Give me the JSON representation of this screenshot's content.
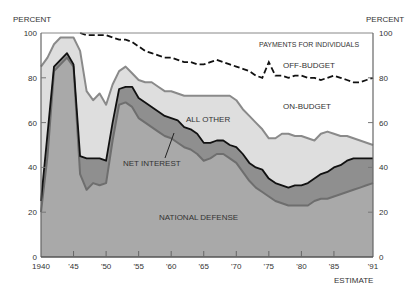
{
  "chart_data": {
    "type": "area",
    "title": "",
    "ylabel_left": "PERCENT",
    "ylabel_right": "PERCENT",
    "xlabel": "ESTIMATE",
    "ylim": [
      0,
      100
    ],
    "xlim": [
      1940,
      1991
    ],
    "x_ticks": [
      {
        "year": 1940,
        "label": "1940"
      },
      {
        "year": 1945,
        "label": "'45"
      },
      {
        "year": 1950,
        "label": "'50"
      },
      {
        "year": 1955,
        "label": "'55"
      },
      {
        "year": 1960,
        "label": "'60"
      },
      {
        "year": 1965,
        "label": "'65"
      },
      {
        "year": 1970,
        "label": "'70"
      },
      {
        "year": 1975,
        "label": "'75"
      },
      {
        "year": 1980,
        "label": "'80"
      },
      {
        "year": 1985,
        "label": "'85"
      },
      {
        "year": 1991,
        "label": "'91"
      }
    ],
    "y_ticks": [
      0,
      20,
      40,
      60,
      80,
      100
    ],
    "annotations": {
      "payments_for_individuals": "PAYMENTS FOR INDIVIDUALS",
      "off_budget": "OFF-BUDGET",
      "on_budget": "ON-BUDGET",
      "all_other": "ALL OTHER",
      "net_interest": "NET INTEREST",
      "national_defense": "NATIONAL DEFENSE"
    },
    "series": [
      {
        "name": "National Defense",
        "kind": "cumulative_top",
        "color": "#a9a9a9",
        "line_color": "#6e6e6e",
        "points": [
          [
            1940,
            20
          ],
          [
            1941,
            45
          ],
          [
            1942,
            83
          ],
          [
            1943,
            86
          ],
          [
            1944,
            89
          ],
          [
            1945,
            85
          ],
          [
            1946,
            37
          ],
          [
            1947,
            30
          ],
          [
            1948,
            33
          ],
          [
            1949,
            32
          ],
          [
            1950,
            33
          ],
          [
            1951,
            52
          ],
          [
            1952,
            68
          ],
          [
            1953,
            69
          ],
          [
            1954,
            67
          ],
          [
            1955,
            62
          ],
          [
            1956,
            60
          ],
          [
            1957,
            58
          ],
          [
            1958,
            56
          ],
          [
            1959,
            54
          ],
          [
            1960,
            53
          ],
          [
            1961,
            51
          ],
          [
            1962,
            49
          ],
          [
            1963,
            48
          ],
          [
            1964,
            46
          ],
          [
            1965,
            43
          ],
          [
            1966,
            44
          ],
          [
            1967,
            46
          ],
          [
            1968,
            46
          ],
          [
            1969,
            44
          ],
          [
            1970,
            42
          ],
          [
            1971,
            38
          ],
          [
            1972,
            34
          ],
          [
            1973,
            31
          ],
          [
            1974,
            29
          ],
          [
            1975,
            27
          ],
          [
            1976,
            25
          ],
          [
            1977,
            24
          ],
          [
            1978,
            23
          ],
          [
            1979,
            23
          ],
          [
            1980,
            23
          ],
          [
            1981,
            23
          ],
          [
            1982,
            25
          ],
          [
            1983,
            26
          ],
          [
            1984,
            26
          ],
          [
            1985,
            27
          ],
          [
            1986,
            28
          ],
          [
            1987,
            29
          ],
          [
            1988,
            30
          ],
          [
            1989,
            31
          ],
          [
            1990,
            32
          ],
          [
            1991,
            33
          ]
        ]
      },
      {
        "name": "Net Interest",
        "kind": "cumulative_top",
        "color": "#8f8f8f",
        "line_color": "#111111",
        "points": [
          [
            1940,
            25
          ],
          [
            1941,
            55
          ],
          [
            1942,
            85
          ],
          [
            1943,
            88
          ],
          [
            1944,
            91
          ],
          [
            1945,
            86
          ],
          [
            1946,
            45
          ],
          [
            1947,
            44
          ],
          [
            1948,
            44
          ],
          [
            1949,
            44
          ],
          [
            1950,
            43
          ],
          [
            1951,
            60
          ],
          [
            1952,
            75
          ],
          [
            1953,
            76
          ],
          [
            1954,
            76
          ],
          [
            1955,
            71
          ],
          [
            1956,
            69
          ],
          [
            1957,
            67
          ],
          [
            1958,
            65
          ],
          [
            1959,
            63
          ],
          [
            1960,
            62
          ],
          [
            1961,
            61
          ],
          [
            1962,
            58
          ],
          [
            1963,
            57
          ],
          [
            1964,
            55
          ],
          [
            1965,
            51
          ],
          [
            1966,
            51
          ],
          [
            1967,
            52
          ],
          [
            1968,
            52
          ],
          [
            1969,
            50
          ],
          [
            1970,
            49
          ],
          [
            1971,
            46
          ],
          [
            1972,
            42
          ],
          [
            1973,
            40
          ],
          [
            1974,
            39
          ],
          [
            1975,
            35
          ],
          [
            1976,
            33
          ],
          [
            1977,
            32
          ],
          [
            1978,
            31
          ],
          [
            1979,
            32
          ],
          [
            1980,
            32
          ],
          [
            1981,
            33
          ],
          [
            1982,
            35
          ],
          [
            1983,
            37
          ],
          [
            1984,
            38
          ],
          [
            1985,
            40
          ],
          [
            1986,
            41
          ],
          [
            1987,
            43
          ],
          [
            1988,
            44
          ],
          [
            1989,
            44
          ],
          [
            1990,
            44
          ],
          [
            1991,
            44
          ]
        ]
      },
      {
        "name": "All Other",
        "kind": "cumulative_top",
        "color": "#dedede",
        "line_color": "#8a8a8a",
        "points": [
          [
            1940,
            85
          ],
          [
            1941,
            89
          ],
          [
            1942,
            95
          ],
          [
            1943,
            98
          ],
          [
            1944,
            98
          ],
          [
            1945,
            98
          ],
          [
            1946,
            92
          ],
          [
            1947,
            74
          ],
          [
            1948,
            70
          ],
          [
            1949,
            73
          ],
          [
            1950,
            68
          ],
          [
            1951,
            77
          ],
          [
            1952,
            83
          ],
          [
            1953,
            85
          ],
          [
            1954,
            82
          ],
          [
            1955,
            79
          ],
          [
            1956,
            78
          ],
          [
            1957,
            78
          ],
          [
            1958,
            76
          ],
          [
            1959,
            74
          ],
          [
            1960,
            74
          ],
          [
            1961,
            73
          ],
          [
            1962,
            72
          ],
          [
            1963,
            72
          ],
          [
            1964,
            72
          ],
          [
            1965,
            72
          ],
          [
            1966,
            72
          ],
          [
            1967,
            72
          ],
          [
            1968,
            72
          ],
          [
            1969,
            72
          ],
          [
            1970,
            70
          ],
          [
            1971,
            66
          ],
          [
            1972,
            63
          ],
          [
            1973,
            60
          ],
          [
            1974,
            57
          ],
          [
            1975,
            53
          ],
          [
            1976,
            53
          ],
          [
            1977,
            55
          ],
          [
            1978,
            55
          ],
          [
            1979,
            54
          ],
          [
            1980,
            54
          ],
          [
            1981,
            53
          ],
          [
            1982,
            52
          ],
          [
            1983,
            55
          ],
          [
            1984,
            56
          ],
          [
            1985,
            55
          ],
          [
            1986,
            54
          ],
          [
            1987,
            54
          ],
          [
            1988,
            53
          ],
          [
            1989,
            52
          ],
          [
            1990,
            51
          ],
          [
            1991,
            50
          ]
        ]
      },
      {
        "name": "Payments for Individuals (On-Budget)",
        "kind": "cumulative_top_dashed",
        "color": "#ffffff",
        "line_color": "#111111",
        "points": [
          [
            1946,
            100
          ],
          [
            1947,
            99
          ],
          [
            1948,
            99
          ],
          [
            1949,
            99
          ],
          [
            1950,
            99
          ],
          [
            1951,
            98
          ],
          [
            1952,
            97
          ],
          [
            1953,
            97
          ],
          [
            1954,
            96
          ],
          [
            1955,
            94
          ],
          [
            1956,
            92
          ],
          [
            1957,
            91
          ],
          [
            1958,
            90
          ],
          [
            1959,
            89
          ],
          [
            1960,
            89
          ],
          [
            1961,
            88
          ],
          [
            1962,
            87
          ],
          [
            1963,
            87
          ],
          [
            1964,
            86
          ],
          [
            1965,
            86
          ],
          [
            1966,
            87
          ],
          [
            1967,
            88
          ],
          [
            1968,
            87
          ],
          [
            1969,
            86
          ],
          [
            1970,
            85
          ],
          [
            1971,
            84
          ],
          [
            1972,
            83
          ],
          [
            1973,
            81
          ],
          [
            1974,
            80
          ],
          [
            1975,
            87
          ],
          [
            1976,
            81
          ],
          [
            1977,
            81
          ],
          [
            1978,
            80
          ],
          [
            1979,
            81
          ],
          [
            1980,
            81
          ],
          [
            1981,
            80
          ],
          [
            1982,
            80
          ],
          [
            1983,
            79
          ],
          [
            1984,
            80
          ],
          [
            1985,
            81
          ],
          [
            1986,
            80
          ],
          [
            1987,
            79
          ],
          [
            1988,
            78
          ],
          [
            1989,
            78
          ],
          [
            1990,
            79
          ],
          [
            1991,
            80
          ]
        ]
      },
      {
        "name": "Payments for Individuals (Off-Budget)",
        "kind": "remainder_to_100",
        "color": "#ffffff",
        "points": []
      }
    ],
    "grid": false,
    "legend": "inline annotations"
  },
  "labels": {
    "ylabel_left": "PERCENT",
    "ylabel_right": "PERCENT",
    "estimate": "ESTIMATE",
    "payments_for_individuals": "PAYMENTS FOR INDIVIDUALS",
    "off_budget": "OFF-BUDGET",
    "on_budget": "ON-BUDGET",
    "all_other": "ALL OTHER",
    "net_interest": "NET INTEREST",
    "national_defense": "NATIONAL DEFENSE"
  }
}
